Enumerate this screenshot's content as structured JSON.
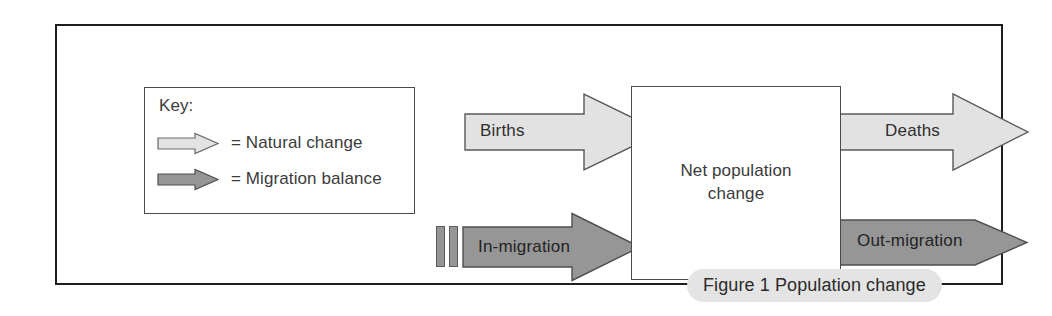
{
  "figure": {
    "caption": "Figure 1 Population change",
    "title_text": "Figure 1 Population change"
  },
  "key": {
    "title": "Key:",
    "items": [
      {
        "label": "= Natural change",
        "swatch": "light-arrow",
        "color": "#e2e2e2"
      },
      {
        "label": "= Migration balance",
        "swatch": "dark-arrow",
        "color": "#969696"
      }
    ]
  },
  "diagram": {
    "centre": {
      "line1": "Net population",
      "line2": "change"
    },
    "flows": [
      {
        "id": "births",
        "label": "Births",
        "direction": "in",
        "type": "natural",
        "color": "#e2e2e2"
      },
      {
        "id": "deaths",
        "label": "Deaths",
        "direction": "out",
        "type": "natural",
        "color": "#e2e2e2"
      },
      {
        "id": "in-migration",
        "label": "In-migration",
        "direction": "in",
        "type": "migration",
        "color": "#969696"
      },
      {
        "id": "out-migration",
        "label": "Out-migration",
        "direction": "out",
        "type": "migration",
        "color": "#969696"
      }
    ]
  },
  "colors": {
    "natural_fill": "#e2e2e2",
    "migration_fill": "#969696",
    "outline": "#4a4a4a",
    "frame": "#1e1e1e",
    "caption_pill": "#e4e4e4",
    "text": "#3b3b3b"
  }
}
